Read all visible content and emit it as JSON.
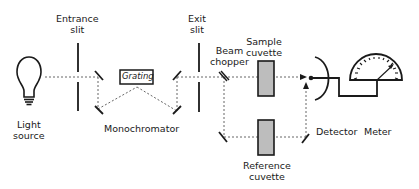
{
  "labels": {
    "light_source": [
      "Light",
      "source"
    ],
    "entrance_slit": [
      "Entrance",
      "slit"
    ],
    "grating": "Grating",
    "monochromator": "Monochromator",
    "exit_slit": [
      "Exit",
      "slit"
    ],
    "beam_chopper": [
      "Beam",
      "chopper"
    ],
    "sample_cuvette": [
      "Sample",
      "cuvette"
    ],
    "reference_cuvette": [
      "Reference",
      "cuvette"
    ],
    "detector": "Detector",
    "meter": "Meter"
  },
  "colors": {
    "line": "#1a1a1a",
    "cuvette_fill": "#bdbdbd",
    "beam": "#555555"
  }
}
